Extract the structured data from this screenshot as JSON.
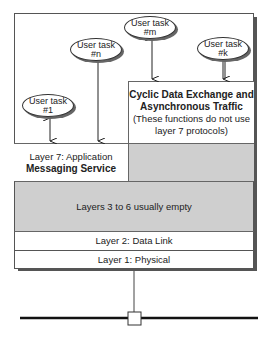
{
  "diagram": {
    "user_tasks": [
      {
        "name": "User task",
        "id": "#1"
      },
      {
        "name": "User task",
        "id": "#n"
      },
      {
        "name": "User task",
        "id": "#m"
      },
      {
        "name": "User task",
        "id": "#k"
      }
    ],
    "cyclic": {
      "title_line1": "Cyclic Data Exchange and",
      "title_line2": "Asynchronous Traffic",
      "note_line1": "(These functions do not use",
      "note_line2": "layer 7 protocols)"
    },
    "layer7": {
      "line1": "Layer 7: Application",
      "line2": "Messaging Service"
    },
    "layers3to6": "Layers 3 to 6 usually empty",
    "layer2": "Layer 2: Data Link",
    "layer1": "Layer 1: Physical",
    "colors": {
      "grey_fill": "#cfcfcf",
      "line": "#222222"
    }
  }
}
